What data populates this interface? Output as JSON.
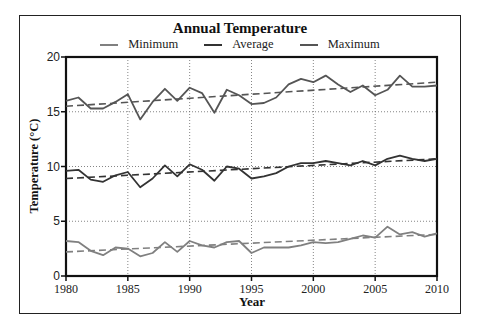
{
  "chart_data": {
    "type": "line",
    "title": "Annual Temperature",
    "xlabel": "Year",
    "ylabel": "Temperature (°C)",
    "xlim": [
      1980,
      2010
    ],
    "ylim": [
      0,
      20
    ],
    "xticks": [
      1980,
      1985,
      1990,
      1995,
      2000,
      2005,
      2010
    ],
    "yticks": [
      0,
      5,
      10,
      15,
      20
    ],
    "grid": "dotted, at major ticks",
    "legend_position": "top center, horizontal",
    "x": [
      1980,
      1981,
      1982,
      1983,
      1984,
      1985,
      1986,
      1987,
      1988,
      1989,
      1990,
      1991,
      1992,
      1993,
      1994,
      1995,
      1996,
      1997,
      1998,
      1999,
      2000,
      2001,
      2002,
      2003,
      2004,
      2005,
      2006,
      2007,
      2008,
      2009,
      2010
    ],
    "series": [
      {
        "name": "Minimum",
        "color": "#808080",
        "values": [
          3.2,
          3.1,
          2.3,
          1.9,
          2.6,
          2.5,
          1.8,
          2.1,
          3.1,
          2.2,
          3.2,
          2.8,
          2.6,
          3.1,
          3.2,
          2.1,
          2.6,
          2.6,
          2.6,
          2.8,
          3.1,
          3.0,
          3.1,
          3.4,
          3.7,
          3.5,
          4.5,
          3.8,
          4.0,
          3.6,
          3.9
        ],
        "trend": {
          "start": 2.2,
          "end": 3.8,
          "style": "dashed"
        }
      },
      {
        "name": "Average",
        "color": "#333333",
        "values": [
          9.6,
          9.7,
          8.8,
          8.6,
          9.2,
          9.5,
          8.1,
          8.9,
          10.1,
          9.1,
          10.2,
          9.7,
          8.7,
          10.0,
          9.8,
          8.9,
          9.1,
          9.4,
          10.0,
          10.3,
          10.3,
          10.5,
          10.3,
          10.1,
          10.5,
          10.1,
          10.7,
          11.0,
          10.7,
          10.5,
          10.7
        ],
        "trend": {
          "start": 8.9,
          "end": 10.7,
          "style": "dashed"
        }
      },
      {
        "name": "Maximum",
        "color": "#555555",
        "values": [
          16.0,
          16.3,
          15.3,
          15.3,
          15.9,
          16.6,
          14.3,
          15.9,
          17.1,
          16.0,
          17.2,
          16.7,
          14.9,
          17.0,
          16.5,
          15.7,
          15.8,
          16.3,
          17.5,
          18.0,
          17.7,
          18.3,
          17.5,
          16.8,
          17.4,
          16.5,
          17.0,
          18.3,
          17.3,
          17.3,
          17.4
        ],
        "trend": {
          "start": 15.5,
          "end": 17.7,
          "style": "dashed"
        }
      }
    ]
  },
  "legend": [
    {
      "label": "Minimum",
      "color": "#808080"
    },
    {
      "label": "Average",
      "color": "#333333"
    },
    {
      "label": "Maximum",
      "color": "#555555"
    }
  ]
}
